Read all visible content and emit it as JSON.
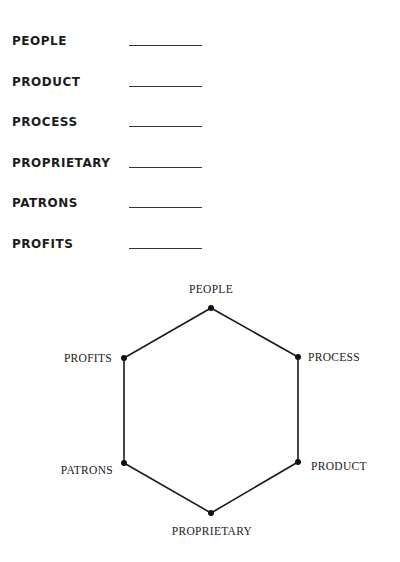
{
  "worksheet": {
    "rows": [
      {
        "label": "PEOPLE",
        "blank": ""
      },
      {
        "label": "PRODUCT",
        "blank": ""
      },
      {
        "label": "PROCESS",
        "blank": ""
      },
      {
        "label": "PROPRIETARY",
        "blank": ""
      },
      {
        "label": "PATRONS",
        "blank": ""
      },
      {
        "label": "PROFITS",
        "blank": ""
      }
    ]
  },
  "diagram": {
    "shape": "hexagon",
    "line_color": "#1a1a1a",
    "vertices": [
      {
        "label": "PEOPLE",
        "position": "top"
      },
      {
        "label": "PROCESS",
        "position": "upper-right"
      },
      {
        "label": "PRODUCT",
        "position": "lower-right"
      },
      {
        "label": "PROPRIETARY",
        "position": "bottom"
      },
      {
        "label": "PATRONS",
        "position": "lower-left"
      },
      {
        "label": "PROFITS",
        "position": "upper-left"
      }
    ]
  }
}
